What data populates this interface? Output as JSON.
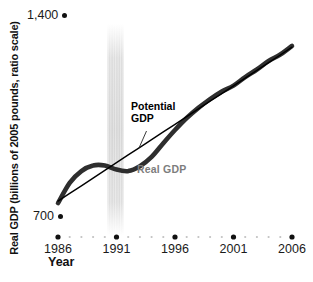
{
  "axes": {
    "y_title": "Real GDP (billions of 2005 pounds, ratio scale)",
    "x_title": "Year",
    "y_tick_top": "1,400",
    "y_tick_bottom": "700"
  },
  "annotations": {
    "potential_gdp": "Potential\nGDP",
    "real_gdp": "Real GDP"
  },
  "colors": {
    "real_line": "#2e2e2e",
    "potential_line": "#000000",
    "real_label": "#7d7d7d",
    "recession_band": "#b9b9b9",
    "major_dot": "#111111",
    "minor_dot": "#c2c2c2"
  },
  "chart_data": {
    "type": "line",
    "title": "",
    "xlabel": "Year",
    "ylabel": "Real GDP (billions of 2005 pounds, ratio scale)",
    "yscale": "log (ratio scale)",
    "yticks": [
      700,
      1400
    ],
    "ytick_labels": [
      "700",
      "1,400"
    ],
    "xticks_major": [
      1986,
      1991,
      1996,
      2001,
      2006
    ],
    "xticks_minor_every_year": true,
    "x_range": [
      1986,
      2006
    ],
    "recession_band_year": 1991,
    "x": [
      1986,
      1987,
      1988,
      1989,
      1990,
      1991,
      1992,
      1993,
      1994,
      1995,
      1996,
      1997,
      1998,
      1999,
      2000,
      2001,
      2002,
      2003,
      2004,
      2005,
      2006
    ],
    "series": [
      {
        "name": "Real GDP",
        "color": "#2e2e2e",
        "stroke_width": 4.6,
        "values": [
          732,
          785,
          818,
          834,
          834,
          822,
          818,
          832,
          859,
          901,
          943,
          983,
          1018,
          1050,
          1078,
          1100,
          1133,
          1163,
          1198,
          1225,
          1262
        ]
      },
      {
        "name": "Potential GDP",
        "color": "#000000",
        "stroke_width": 1.4,
        "values": [
          737,
          757,
          777,
          798,
          820,
          842,
          865,
          888,
          912,
          937,
          962,
          988,
          1015,
          1042,
          1070,
          1099,
          1129,
          1160,
          1191,
          1223,
          1257
        ]
      }
    ]
  }
}
